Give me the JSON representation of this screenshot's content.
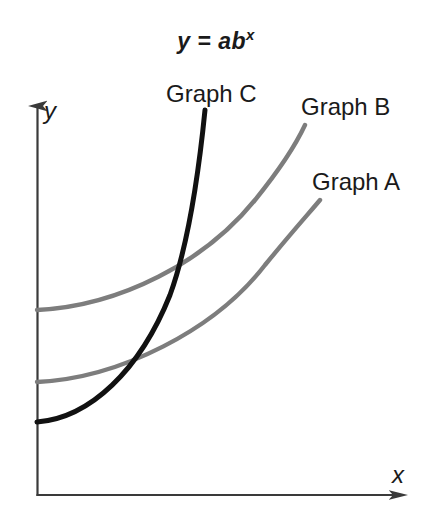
{
  "figure": {
    "width": 432,
    "height": 528,
    "background": "#ffffff"
  },
  "title": {
    "base": "y = ab",
    "exponent": "x",
    "full": "y = ab^x"
  },
  "axes": {
    "x_label": "x",
    "y_label": "y",
    "axis_color": "#3a3a3a",
    "origin_x": 37,
    "origin_y": 495,
    "x_axis_end": 410,
    "y_axis_top": 100
  },
  "labels": {
    "graph_a": "Graph A",
    "graph_b": "Graph B",
    "graph_c": "Graph C"
  },
  "colors": {
    "curve_gray": "#7d7d7d",
    "curve_black": "#111111",
    "text": "#1a1a1a"
  },
  "chart_data": {
    "type": "line",
    "xlabel": "x",
    "ylabel": "y",
    "grid": false,
    "legend": "inline-curve-labels",
    "axis_ticks": [],
    "xlim": [
      0,
      10
    ],
    "ylim": [
      0,
      10
    ],
    "series": [
      {
        "name": "Graph A",
        "color": "#7d7d7d",
        "label_position": "above-right-end",
        "y_intercept_px": 382,
        "path_px": "M 37 382 C 120 378, 215 330, 265 265 C 292 232, 310 212, 320 200",
        "points_px": [
          [
            37,
            382
          ],
          [
            80,
            378
          ],
          [
            130,
            364
          ],
          [
            175,
            340
          ],
          [
            215,
            308
          ],
          [
            250,
            272
          ],
          [
            285,
            234
          ],
          [
            320,
            200
          ]
        ],
        "note": "smallest growth factor b; lowest starting value among gray curves"
      },
      {
        "name": "Graph B",
        "color": "#7d7d7d",
        "label_position": "above-right-end",
        "y_intercept_px": 310,
        "path_px": "M 37 310 C 120 306, 205 262, 255 200 C 285 163, 298 140, 305 125",
        "points_px": [
          [
            37,
            310
          ],
          [
            80,
            306
          ],
          [
            125,
            293
          ],
          [
            170,
            270
          ],
          [
            210,
            240
          ],
          [
            248,
            200
          ],
          [
            280,
            160
          ],
          [
            305,
            125
          ]
        ],
        "note": "medium growth factor b; highest y-intercept"
      },
      {
        "name": "Graph C",
        "color": "#111111",
        "label_position": "above-top-end",
        "y_intercept_px": 422,
        "path_px": "M 37 422 C 90 418, 140 370, 170 295 C 190 240, 200 160, 205 110",
        "points_px": [
          [
            37,
            422
          ],
          [
            70,
            418
          ],
          [
            100,
            405
          ],
          [
            128,
            383
          ],
          [
            152,
            352
          ],
          [
            172,
            310
          ],
          [
            188,
            255
          ],
          [
            198,
            190
          ],
          [
            205,
            110
          ]
        ],
        "note": "largest growth factor b; lowest y-intercept, steepest rise, crosses both gray curves"
      }
    ]
  }
}
